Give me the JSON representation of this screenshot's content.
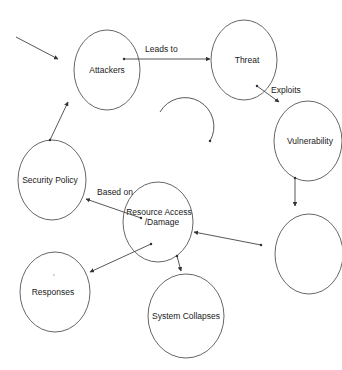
{
  "diagram": {
    "type": "flow-cycle",
    "nodes": [
      {
        "id": "attackers",
        "label": "Attackers",
        "cx": 107,
        "cy": 70,
        "rx": 33,
        "ry": 40
      },
      {
        "id": "threat",
        "label": "Threat",
        "cx": 244,
        "cy": 60,
        "rx": 33,
        "ry": 40
      },
      {
        "id": "vulnerability",
        "label": "Vulnerability",
        "cx": 308,
        "cy": 141,
        "rx": 34,
        "ry": 40
      },
      {
        "id": "empty",
        "label": "",
        "cx": 309,
        "cy": 254,
        "rx": 34,
        "ry": 40
      },
      {
        "id": "resource",
        "label_line1": "Resource Access",
        "label_line2": "/Damage",
        "cx": 158,
        "cy": 222,
        "rx": 35,
        "ry": 40
      },
      {
        "id": "security",
        "label": "Security Policy",
        "cx": 52,
        "cy": 180,
        "rx": 34,
        "ry": 40
      },
      {
        "id": "responses",
        "label": "Responses",
        "cx": 55,
        "cy": 292,
        "rx": 35,
        "ry": 40
      },
      {
        "id": "collapse",
        "label": "System Collapses",
        "cx": 186,
        "cy": 316,
        "rx": 38,
        "ry": 42
      }
    ],
    "edges": [
      {
        "from": "external",
        "to": "attackers",
        "label": ""
      },
      {
        "from": "attackers",
        "to": "threat",
        "label": "Leads to"
      },
      {
        "from": "threat",
        "to": "vulnerability",
        "label": "Exploits"
      },
      {
        "from": "vulnerability",
        "to": "empty",
        "label": ""
      },
      {
        "from": "empty",
        "to": "resource",
        "label": ""
      },
      {
        "from": "resource",
        "to": "security",
        "label": "Based on"
      },
      {
        "from": "resource",
        "to": "responses",
        "label": ""
      },
      {
        "from": "resource",
        "to": "collapse",
        "label": ""
      },
      {
        "from": "security",
        "to": "attackers",
        "label": ""
      }
    ],
    "cycle_arrow": "clockwise-arc"
  },
  "labels": {
    "attackers": "Attackers",
    "threat": "Threat",
    "vulnerability": "Vulnerability",
    "resource_line1": "Resource Access",
    "resource_line2": "/Damage",
    "security": "Security Policy",
    "responses": "Responses",
    "collapse": "System Collapses",
    "leads_to": "Leads to",
    "exploits": "Exploits",
    "based_on": "Based on"
  },
  "colors": {
    "stroke": "#555555",
    "text": "#1a1a1a",
    "background": "#ffffff"
  }
}
